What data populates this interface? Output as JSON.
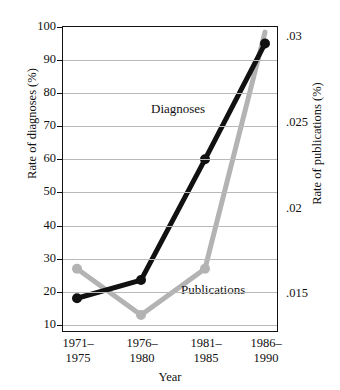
{
  "chart_data": {
    "type": "line",
    "title": "",
    "xlabel": "Year",
    "categories": [
      "1971–\n1975",
      "1976–\n1980",
      "1981–\n1985",
      "1986–\n1990"
    ],
    "categories_split": [
      [
        "1971–",
        "1975"
      ],
      [
        "1976–",
        "1980"
      ],
      [
        "1981–",
        "1985"
      ],
      [
        "1986–",
        "1990"
      ]
    ],
    "grid": true,
    "legend": "inline-annotations",
    "axes": {
      "left": {
        "label": "Rate of diagnoses (%)",
        "ticks": [
          100,
          90,
          80,
          70,
          60,
          50,
          40,
          30,
          20,
          10
        ],
        "tick_labels": [
          "100",
          "90",
          "80",
          "70",
          "60",
          "50",
          "40",
          "30",
          "20",
          "10"
        ],
        "min": 7.5,
        "max": 100
      },
      "right": {
        "label": "Rate of publications (%)",
        "tick_labels": [
          ".03",
          ".025",
          ".02",
          ".015"
        ],
        "tick_values": [
          0.03,
          0.025,
          0.02,
          0.015
        ],
        "min": 0.01275,
        "max": 0.0306
      }
    },
    "series": [
      {
        "name": "Diagnoses",
        "axis": "left",
        "color": "#111111",
        "values": [
          18,
          23.5,
          60,
          95
        ],
        "annotation": "Diagnoses"
      },
      {
        "name": "Publications",
        "axis": "right",
        "color": "#b3b3b3",
        "values": [
          0.0165,
          0.0138,
          0.0165,
          0.0303
        ],
        "values_on_left_scale": [
          31.5,
          17.5,
          31.5,
          95
        ],
        "annotation": "Publications"
      }
    ]
  },
  "annotations": {
    "diagnoses_label": "Diagnoses",
    "publications_label": "Publications"
  }
}
